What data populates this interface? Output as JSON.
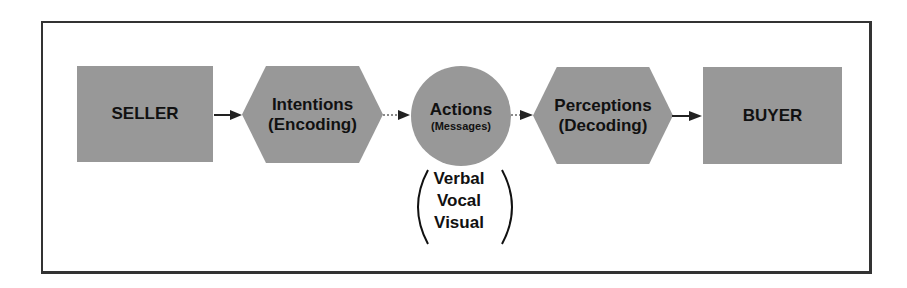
{
  "diagram": {
    "nodes": [
      {
        "id": "seller",
        "shape": "rectangle",
        "label": "SELLER"
      },
      {
        "id": "intentions",
        "shape": "hexagon",
        "label": "Intentions",
        "sublabel": "(Encoding)"
      },
      {
        "id": "actions",
        "shape": "circle",
        "label": "Actions",
        "sublabel": "(Messages)"
      },
      {
        "id": "perceptions",
        "shape": "hexagon",
        "label": "Perceptions",
        "sublabel": "(Decoding)"
      },
      {
        "id": "buyer",
        "shape": "rectangle",
        "label": "BUYER"
      }
    ],
    "edges": [
      {
        "from": "seller",
        "to": "intentions",
        "style": "solid"
      },
      {
        "from": "intentions",
        "to": "actions",
        "style": "dotted"
      },
      {
        "from": "actions",
        "to": "perceptions",
        "style": "dotted"
      },
      {
        "from": "perceptions",
        "to": "buyer",
        "style": "solid"
      }
    ],
    "action_modes": [
      "Verbal",
      "Vocal",
      "Visual"
    ],
    "colors": {
      "node_fill": "#989898",
      "text": "#111111",
      "border": "#333333"
    }
  }
}
